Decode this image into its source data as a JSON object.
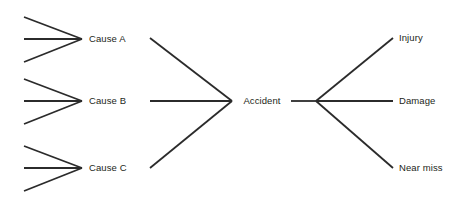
{
  "diagram": {
    "type": "bow-tie-risk-diagram",
    "background_color": "#ffffff",
    "line_color": "#2b2b2b",
    "text_color": "#231f20",
    "center_node": {
      "label": "Accident",
      "x": 262,
      "y": 101
    },
    "causes": [
      {
        "label": "Cause A",
        "label_x": 89,
        "label_y": 39,
        "vertex_x": 82,
        "vertex_y": 39,
        "sub_inputs": 3
      },
      {
        "label": "Cause B",
        "label_x": 89,
        "label_y": 101,
        "vertex_x": 82,
        "vertex_y": 101,
        "sub_inputs": 3
      },
      {
        "label": "Cause C",
        "label_x": 89,
        "label_y": 168,
        "vertex_x": 82,
        "vertex_y": 168,
        "sub_inputs": 3
      }
    ],
    "consequences": [
      {
        "label": "Injury",
        "label_x": 399,
        "label_y": 38,
        "end_x": 393,
        "end_y": 38
      },
      {
        "label": "Damage",
        "label_x": 399,
        "label_y": 101,
        "end_x": 393,
        "end_y": 101
      },
      {
        "label": "Near miss",
        "label_x": 399,
        "label_y": 168,
        "end_x": 393,
        "end_y": 168
      }
    ],
    "fan_vertex": {
      "x": 316,
      "y": 101
    }
  }
}
